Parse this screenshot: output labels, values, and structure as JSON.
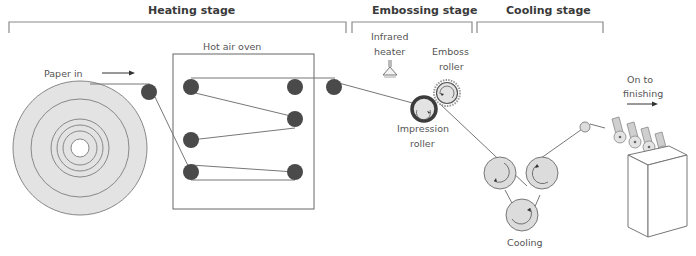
{
  "stages": [
    {
      "label": "Heating stage"
    },
    {
      "label": "Embossing stage"
    },
    {
      "label": "Cooling stage"
    }
  ],
  "labels": {
    "paper_in": "Paper in",
    "hot_air_oven": "Hot air oven",
    "infrared_heater_1": "Infrared",
    "infrared_heater_2": "heater",
    "emboss_roller_1": "Emboss",
    "emboss_roller_2": "roller",
    "impression_roller_1": "Impression",
    "impression_roller_2": "roller",
    "cooling": "Cooling",
    "on_to_1": "On to",
    "on_to_2": "finishing"
  },
  "colors": {
    "roller_dark": "#4a4a4a",
    "roll_fill": "#e3e3e3",
    "line": "#666666",
    "cooling_roller_fill": "#dcdcdc"
  }
}
